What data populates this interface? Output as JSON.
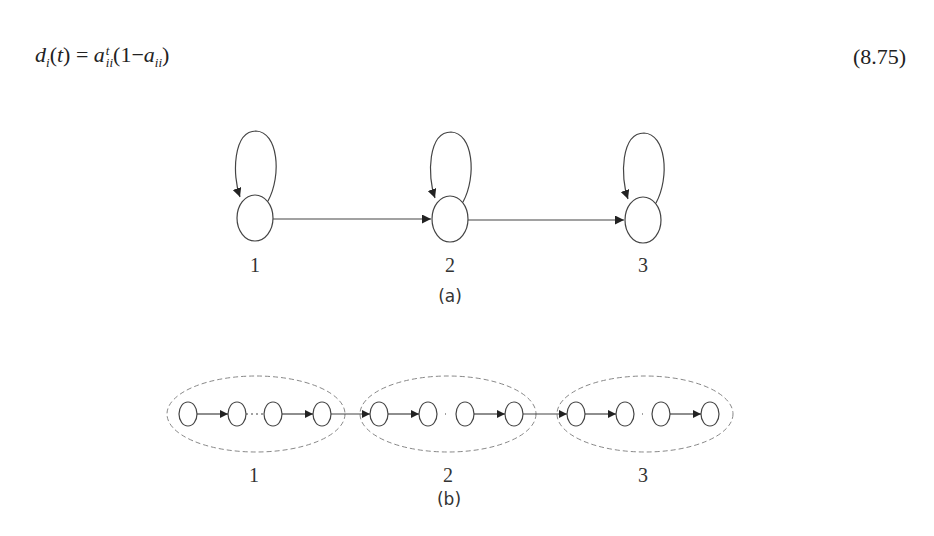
{
  "equation": {
    "lhs_var": "d",
    "lhs_sub": "i",
    "lhs_arg": "(t)",
    "equals": "=",
    "rhs_var": "a",
    "rhs_sup": "t",
    "rhs_sub": "ii",
    "rhs_paren_open": "(1−",
    "rhs_var2": "a",
    "rhs_sub2": "ii",
    "rhs_paren_close": ")",
    "number": "(8.75)"
  },
  "figure_a": {
    "caption": "(a)",
    "nodes": [
      {
        "label": "1"
      },
      {
        "label": "2"
      },
      {
        "label": "3"
      }
    ]
  },
  "figure_b": {
    "caption": "(b)",
    "groups": [
      {
        "label": "1"
      },
      {
        "label": "2"
      },
      {
        "label": "3"
      }
    ]
  },
  "colors": {
    "stroke": "#444444",
    "dashed": "#888888",
    "text": "#333333"
  }
}
